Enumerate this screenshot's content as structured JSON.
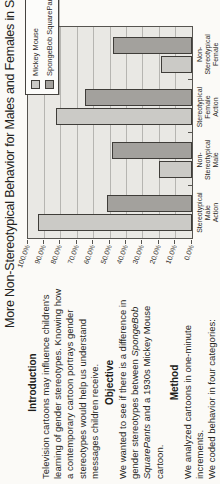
{
  "page": {
    "title": "More Non-Stereotypical Behavior for Males and Females in Spo"
  },
  "sections": [
    {
      "heading": "Introduction",
      "lines": [
        "Television cartoons may influence children's",
        "learning of gender stereotypes.  Knowing how",
        "a contemporary cartoon portrays gender",
        "stereotypes would help us understand",
        "messages children receive."
      ]
    },
    {
      "heading": "Objective",
      "lines": [
        "We wanted to see if there is a difference in",
        "gender stereotypes between *SpongeBob*",
        "*SquarePants* and a 1930s  Mickey Mouse",
        "cartoon."
      ]
    },
    {
      "heading": "Method",
      "lines": [
        "We analyzed cartoons in one-minute",
        "increments.",
        "We coded behavior in four categories:"
      ]
    }
  ],
  "chart_data": {
    "type": "bar",
    "title": "More Non-Stereotypical Behavior for Males and Females in Spo",
    "categories": [
      "Stereotypical Male Action",
      "Non-Stereotypical Male Action",
      "Stereotypical Female Action",
      "Non-Stereotypical Female Action"
    ],
    "series": [
      {
        "name": "Mickey Mouse",
        "values": [
          94,
          20,
          83,
          19
        ],
        "color": "#cbcac6"
      },
      {
        "name": "SpongeBob SquarePants",
        "values": [
          52,
          49,
          65,
          48
        ],
        "color": "#a3a19d"
      }
    ],
    "ylabel": "",
    "ylim": [
      0,
      100
    ],
    "ytick_step": 10,
    "ytick_labels": [
      "0.0%",
      "10.0%",
      "20.0%",
      "30.0%",
      "40.0%",
      "50.0%",
      "60.0%",
      "70.0%",
      "80.0%",
      "90.0%",
      "100.0%"
    ],
    "grid": true,
    "legend_position": "top-right",
    "orientation_note": "page rotated 90deg counterclockwise in screenshot"
  }
}
